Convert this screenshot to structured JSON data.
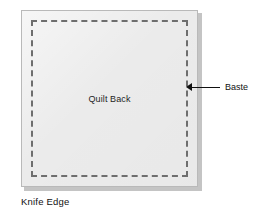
{
  "figure": {
    "caption": "Knife Edge",
    "quilt": {
      "label": "Quilt Back",
      "fill_color": "#ebebeb",
      "border_color": "#b9b9b9",
      "shadow_color": "#c4c4c4"
    },
    "stitching": {
      "style": "dashed",
      "color": "#6e6e6e",
      "edges": [
        "top",
        "right",
        "bottom",
        "left"
      ]
    },
    "callout": {
      "label": "Baste",
      "arrow_direction": "left",
      "line_color": "#111111"
    }
  }
}
